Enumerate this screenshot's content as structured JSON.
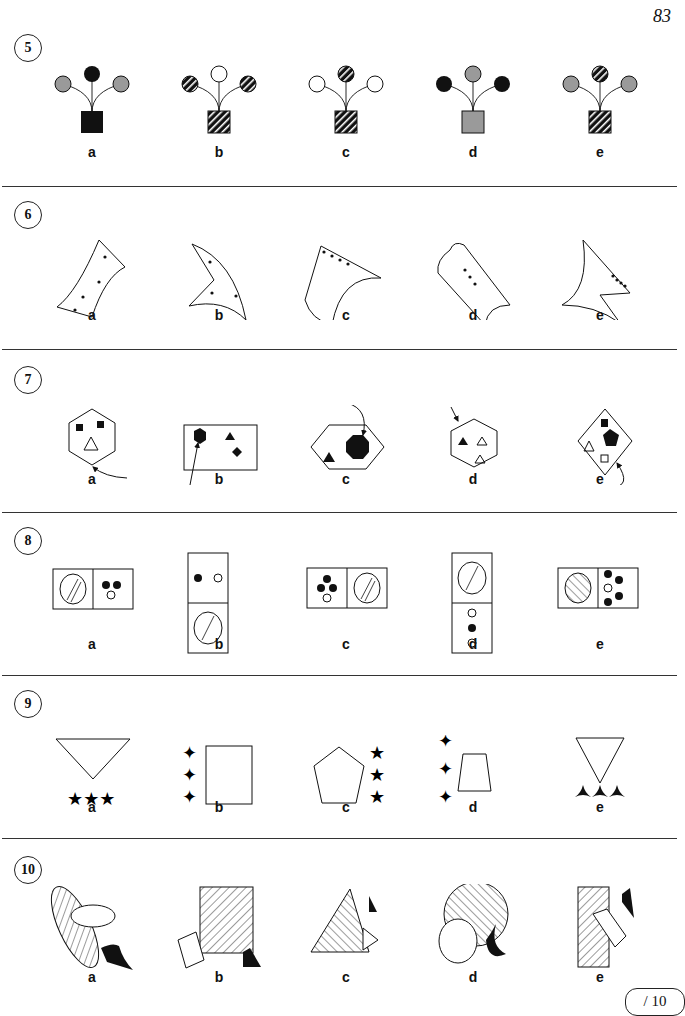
{
  "page": {
    "number": "83",
    "score_box": "/ 10"
  },
  "options": [
    "a",
    "b",
    "c",
    "d",
    "e"
  ],
  "questions": [
    {
      "number": "5",
      "description": "Flower pots with three balloon-like flowers",
      "items": [
        {
          "label": "a",
          "left": "gray",
          "top": "black",
          "right": "gray",
          "pot": "black"
        },
        {
          "label": "b",
          "left": "striped",
          "top": "white",
          "right": "striped",
          "pot": "striped"
        },
        {
          "label": "c",
          "left": "white",
          "top": "striped",
          "right": "white",
          "pot": "striped"
        },
        {
          "label": "d",
          "left": "black",
          "top": "gray",
          "right": "black",
          "pot": "gray"
        },
        {
          "label": "e",
          "left": "gray",
          "top": "striped",
          "right": "gray",
          "pot": "striped"
        }
      ]
    },
    {
      "number": "6",
      "description": "Curved shapes with dots",
      "items": [
        {
          "label": "a",
          "dots": 4
        },
        {
          "label": "b",
          "dots": 3
        },
        {
          "label": "c",
          "dots": 4
        },
        {
          "label": "d",
          "dots": 3
        },
        {
          "label": "e",
          "dots": 4
        }
      ]
    },
    {
      "number": "7",
      "description": "Polygons with inner shapes and arrows",
      "items": [
        {
          "label": "a",
          "outer": "hexagon"
        },
        {
          "label": "b",
          "outer": "rectangle"
        },
        {
          "label": "c",
          "outer": "hexagon"
        },
        {
          "label": "d",
          "outer": "hexagon"
        },
        {
          "label": "e",
          "outer": "diamond"
        }
      ]
    },
    {
      "number": "8",
      "description": "Dominoes with circles",
      "items": [
        {
          "label": "a",
          "orientation": "horizontal"
        },
        {
          "label": "b",
          "orientation": "vertical"
        },
        {
          "label": "c",
          "orientation": "horizontal"
        },
        {
          "label": "d",
          "orientation": "vertical"
        },
        {
          "label": "e",
          "orientation": "horizontal"
        }
      ]
    },
    {
      "number": "9",
      "description": "Shapes with stars",
      "items": [
        {
          "label": "a",
          "shape": "triangle",
          "stars": 3
        },
        {
          "label": "b",
          "shape": "rectangle",
          "stars": 3
        },
        {
          "label": "c",
          "shape": "pentagon",
          "stars": 3
        },
        {
          "label": "d",
          "shape": "trapezoid",
          "stars": 3
        },
        {
          "label": "e",
          "shape": "triangle",
          "stars": 3
        }
      ]
    },
    {
      "number": "10",
      "description": "Overlapping hatched shapes",
      "items": [
        {
          "label": "a",
          "shape": "ellipse"
        },
        {
          "label": "b",
          "shape": "square"
        },
        {
          "label": "c",
          "shape": "triangle"
        },
        {
          "label": "d",
          "shape": "circle"
        },
        {
          "label": "e",
          "shape": "rectangle"
        }
      ]
    }
  ],
  "colors": {
    "gray": "#9a9a9a",
    "black": "#111111",
    "white": "#ffffff"
  }
}
